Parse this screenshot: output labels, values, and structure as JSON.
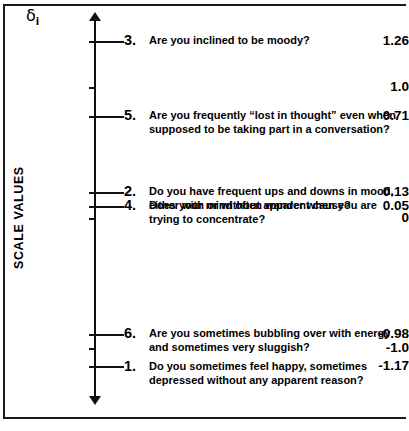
{
  "figure": {
    "axis_symbol": "δ",
    "axis_symbol_subscript": "i",
    "axis_title": "SCALE VALUES",
    "zero_label": "0",
    "ink_color": "#111111"
  },
  "chart_data": {
    "type": "scatter",
    "title": "",
    "subtitle": "",
    "xlabel": "",
    "ylabel": "SCALE VALUES",
    "axis_symbol": "δi",
    "orientation": "vertical-single-axis",
    "grid": false,
    "legend": "none",
    "ylim": [
      -1.4,
      1.45
    ],
    "tick_labels": [
      "1.26",
      "1.0",
      "0.71",
      "0.13",
      "0.05",
      "0",
      "-0.98",
      "-1.0",
      "-1.17"
    ],
    "categories": [
      "3. Are you inclined to be moody?",
      "5. Are you frequently “lost in thought” even when supposed to be taking part in a conversation?",
      "2. Do you have frequent ups and downs in mood, either with or without apparent cause?",
      "4. Does your mind often wander when you are trying to concentrate?",
      "6. Are you sometimes bubbling over with energy and sometimes very sluggish?",
      "1. Do you sometimes feel happy, sometimes depressed without any apparent reason?"
    ],
    "values": [
      1.26,
      0.71,
      0.13,
      0.05,
      -0.98,
      -1.17
    ]
  },
  "ticks": [
    {
      "label": "1.26",
      "value": 1.26,
      "top": 41,
      "has_leader": true
    },
    {
      "label": "1.0",
      "value": 1.0,
      "top": 87,
      "has_leader": false
    },
    {
      "label": "0.71",
      "value": 0.71,
      "top": 116,
      "has_leader": true
    },
    {
      "label": "0.13",
      "value": 0.13,
      "top": 192,
      "has_leader": true
    },
    {
      "label": "0.05",
      "value": 0.05,
      "top": 206,
      "has_leader": true
    },
    {
      "label": "0",
      "value": 0,
      "top": 218,
      "has_leader": false
    },
    {
      "label": "-0.98",
      "value": -0.98,
      "top": 334,
      "has_leader": true
    },
    {
      "label": "-1.0",
      "value": -1.0,
      "top": 348,
      "has_leader": false
    },
    {
      "label": "-1.17",
      "value": -1.17,
      "top": 366,
      "has_leader": true
    }
  ],
  "items": [
    {
      "number": "3.",
      "text": "Are you inclined to be moody?",
      "value": 1.26,
      "top": 34
    },
    {
      "number": "5.",
      "text": "Are you frequently “lost in thought” even when supposed to be taking part in a conversation?",
      "value": 0.71,
      "top": 109
    },
    {
      "number": "2.",
      "text": "Do you have frequent ups and downs in mood, either with or without apparent cause?",
      "value": 0.13,
      "top": 185
    },
    {
      "number": "4.",
      "text": "Does your mind often wander when you are trying to concentrate?",
      "value": 0.05,
      "top": 199
    },
    {
      "number": "6.",
      "text": "Are you sometimes bubbling over with energy and sometimes very sluggish?",
      "value": -0.98,
      "top": 327
    },
    {
      "number": "1.",
      "text": "Do you sometimes feel happy, sometimes depressed without any apparent reason?",
      "value": -1.17,
      "top": 360
    }
  ]
}
